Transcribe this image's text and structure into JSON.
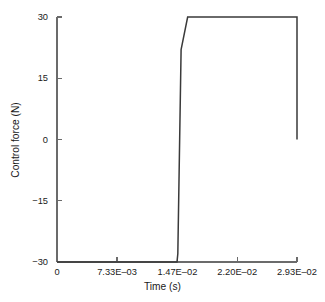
{
  "chart_data": {
    "type": "line",
    "title": "",
    "xlabel": "Time (s)",
    "ylabel": "Control force (N)",
    "xlim": [
      0.0,
      0.0293
    ],
    "ylim": [
      -30,
      30
    ],
    "grid": false,
    "legend": null,
    "line_color": "#3a3a3a",
    "axis_color": "#6b6b6b",
    "xticks": [
      {
        "value": 0.0,
        "label": "0"
      },
      {
        "value": 0.00733,
        "label": "7.33E–03"
      },
      {
        "value": 0.0147,
        "label": "1.47E–02"
      },
      {
        "value": 0.022,
        "label": "2.20E–02"
      },
      {
        "value": 0.0293,
        "label": "2.93E–02"
      }
    ],
    "yticks": [
      {
        "value": 30,
        "label": "30"
      },
      {
        "value": 15,
        "label": "15"
      },
      {
        "value": 0,
        "label": "0"
      },
      {
        "value": -15,
        "label": "−15"
      },
      {
        "value": -30,
        "label": "−30"
      }
    ],
    "series": [
      {
        "name": "Control force",
        "x": [
          0.0,
          0.01465,
          0.01475,
          0.01515,
          0.01595,
          0.0293,
          0.0293
        ],
        "y": [
          -30,
          -30,
          -28.0,
          22.0,
          30.0,
          30.0,
          0.0
        ]
      }
    ],
    "annotations": []
  },
  "figure": {
    "background": "#ffffff"
  }
}
